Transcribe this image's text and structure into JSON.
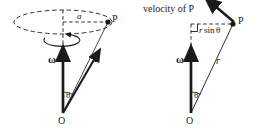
{
  "figure": {
    "title": "",
    "width": 258,
    "height": 130,
    "background": "#ffffff",
    "stroke_color": "#1a1a1a",
    "type": "physics-vector-diagram"
  },
  "left_panel": {
    "labels": {
      "radius": "a",
      "point_p": "P",
      "omega": "ω",
      "r_vector": "r",
      "theta": "θ",
      "origin": "O"
    },
    "elements": {
      "circle_path": "dashed-ellipse",
      "rotation_arrow": "curved-rotation-arrow",
      "axis_line": "dashed-vertical-axis",
      "radius_line": "dashed-horizontal-radius"
    }
  },
  "right_panel": {
    "labels": {
      "velocity": "velocity of P",
      "point_p": "P",
      "perp_distance": "r sin θ",
      "perp_distance_r": "r",
      "perp_distance_sin": "sin",
      "perp_distance_theta": "θ",
      "omega": "ω",
      "r_vector": "r",
      "theta": "θ",
      "origin": "O"
    },
    "elements": {
      "velocity_arrow": "velocity-vector-arrow",
      "right_angle_marker": "right-angle-square",
      "perp_line": "dashed-perpendicular-line",
      "axis_line": "dashed-vertical-axis"
    }
  }
}
